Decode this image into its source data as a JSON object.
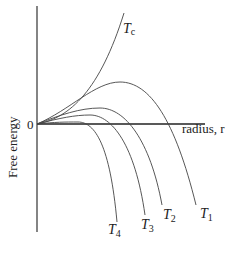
{
  "chart_data": {
    "type": "line",
    "title": "",
    "xlabel": "radius, r",
    "ylabel": "Free energy",
    "origin_label": "0",
    "grid": false,
    "legend": "inline curve labels",
    "series": [
      {
        "name": "Tc",
        "label_main": "T",
        "label_sub": "c",
        "shape": "monotonic increasing (no maximum)"
      },
      {
        "name": "T1",
        "label_main": "T",
        "label_sub": "1",
        "shape": "rises to largest maximum, then falls"
      },
      {
        "name": "T2",
        "label_main": "T",
        "label_sub": "2",
        "shape": "rises to smaller maximum, then falls"
      },
      {
        "name": "T3",
        "label_main": "T",
        "label_sub": "3",
        "shape": "rises to smaller maximum, then falls"
      },
      {
        "name": "T4",
        "label_main": "T",
        "label_sub": "4",
        "shape": "rises to smallest maximum, then falls"
      }
    ],
    "curves_px": {
      "Tc": "M37,124 C70,118 100,90 124,13",
      "T1": "M37,124 C70,110 95,82 120,82 C150,82 175,120 196,205",
      "T2": "M37,124 C60,115 80,108 100,108 C125,108 150,140 162,205",
      "T3": "M37,124 C60,118 75,115 90,115 C112,115 135,145 145,215",
      "T4": "M37,124 C55,122 65,122 78,122 C95,122 110,145 117,222"
    }
  }
}
